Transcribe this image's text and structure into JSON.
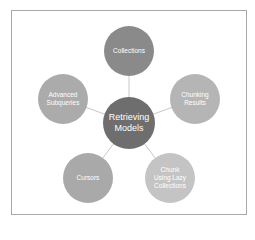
{
  "diagram": {
    "type": "radial-cycle",
    "center": {
      "label_line1": "Retrieving",
      "label_line2": "Models",
      "color": "#6e6e6e"
    },
    "nodes": [
      {
        "id": "collections",
        "lines": [
          "Collections"
        ],
        "color": "#8a8a8a"
      },
      {
        "id": "chunking-results",
        "lines": [
          "Chunking",
          "Results"
        ],
        "color": "#b5b5b5"
      },
      {
        "id": "chunk-lazy",
        "lines": [
          "Chunk",
          "Using Lazy",
          "Collections"
        ],
        "color": "#c4c4c4"
      },
      {
        "id": "cursors",
        "lines": [
          "Cursors"
        ],
        "color": "#a9a9a9"
      },
      {
        "id": "advanced-subqueries",
        "lines": [
          "Advanced",
          "Subqueries"
        ],
        "color": "#ababab"
      }
    ],
    "connector_color": "#c8c8c8",
    "frame_color": "#a8a8a8"
  }
}
